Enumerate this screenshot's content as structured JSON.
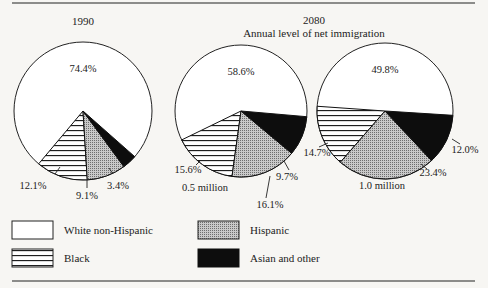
{
  "chart_data": {
    "type": "pie",
    "title": "",
    "group_title": "2080",
    "group_subtitle": "Annual level of net immigration",
    "legend": [
      {
        "key": "white",
        "label": "White non-Hispanic",
        "pattern": "white"
      },
      {
        "key": "black",
        "label": "Black",
        "pattern": "hlines"
      },
      {
        "key": "hispanic",
        "label": "Hispanic",
        "pattern": "crosshatch"
      },
      {
        "key": "asian",
        "label": "Asian and other",
        "pattern": "solid-black"
      }
    ],
    "pies": [
      {
        "title": "1990",
        "subtitle": "",
        "values": {
          "white": 74.4,
          "black": 12.1,
          "hispanic": 9.1,
          "asian": 3.4
        },
        "labels": {
          "white": "74.4%",
          "black": "12.1%",
          "hispanic": "9.1%",
          "asian": "3.4%"
        }
      },
      {
        "title": "",
        "subtitle": "0.5 million",
        "values": {
          "white": 58.6,
          "black": 15.6,
          "hispanic": 16.1,
          "asian": 9.7
        },
        "labels": {
          "white": "58.6%",
          "black": "15.6%",
          "hispanic": "16.1%",
          "asian": "9.7%"
        }
      },
      {
        "title": "",
        "subtitle": "1.0 million",
        "values": {
          "white": 49.8,
          "black": 14.7,
          "hispanic": 23.4,
          "asian": 12.0
        },
        "labels": {
          "white": "49.8%",
          "black": "14.7%",
          "hispanic": "23.4%",
          "asian": "12.0%"
        }
      }
    ]
  },
  "layout": {
    "pies": [
      {
        "cx": 83,
        "cy": 111,
        "r": 69,
        "black_start_deg": 220,
        "title_pos": [
          83,
          22
        ],
        "label_pos": {
          "white": [
            83,
            72
          ],
          "black": [
            33,
            189
          ],
          "hispanic": [
            87,
            199
          ],
          "asian": [
            118,
            189
          ]
        },
        "leaders": {
          "black": [
            [
              55,
              174
            ],
            [
              60,
              167
            ]
          ],
          "hispanic": [
            [
              87,
              180
            ],
            [
              87,
              188
            ]
          ],
          "asian": [
            [
              113,
              174
            ],
            [
              109,
              168
            ]
          ]
        }
      },
      {
        "cx": 241,
        "cy": 111,
        "r": 66,
        "black_start_deg": 244,
        "title_pos": null,
        "sub_pos": [
          205,
          188
        ],
        "label_pos": {
          "white": [
            241,
            75
          ],
          "black": [
            188,
            173
          ],
          "hispanic": [
            270,
            208
          ],
          "asian": [
            287,
            180
          ]
        },
        "leaders": {
          "black": [
            [
              196,
              165
            ],
            [
              200,
              161
            ]
          ],
          "hispanic": [
            [
              266,
              198
            ],
            [
              270,
              176
            ]
          ],
          "asian": [
            [
              289,
              170
            ],
            [
              284,
              161
            ]
          ]
        }
      },
      {
        "cx": 385,
        "cy": 111,
        "r": 68,
        "black_start_deg": 274,
        "title_pos": null,
        "sub_pos": [
          382,
          186
        ],
        "label_pos": {
          "white": [
            385,
            73
          ],
          "black": [
            317,
            156
          ],
          "hispanic": [
            433,
            176
          ],
          "asian": [
            465,
            153
          ]
        },
        "leaders": {
          "black": [
            [
              319,
              147
            ],
            [
              328,
              143
            ]
          ],
          "hispanic": [
            [
              427,
              169
            ],
            [
              421,
              164
            ]
          ],
          "asian": [
            [
              460,
              144
            ],
            [
              452,
              139
            ]
          ]
        }
      }
    ],
    "group_title_pos": [
      314,
      21
    ],
    "group_subtitle_pos": [
      314,
      34
    ]
  }
}
